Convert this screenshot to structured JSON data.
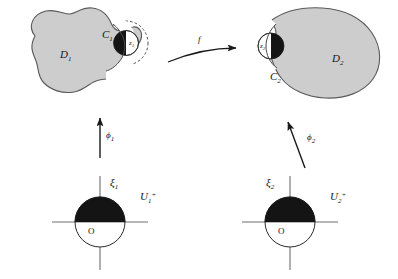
{
  "figure": {
    "type": "mathematical-diagram",
    "background_color": "#ffffff",
    "domain_fill_color": "#cdcdcd",
    "domain_stroke_color": "#5a5a5a",
    "black_fill_color": "#141414",
    "axis_color": "#6e6e6e",
    "arrow_color": "#1a1a1a",
    "dashed_color": "#3c3c3c"
  },
  "left_domain": {
    "region_label": "D",
    "region_sub": "1",
    "boundary_arc_label": "C",
    "boundary_arc_sub": "1",
    "point_label": "z",
    "point_sub": "1"
  },
  "right_domain": {
    "region_label": "D",
    "region_sub": "2",
    "boundary_arc_label": "C",
    "boundary_arc_sub": "2",
    "point_label": "z",
    "point_sub": "2"
  },
  "maps": {
    "horizontal_label": "f",
    "left_vertical_label": "ϕ",
    "left_vertical_sub": "1",
    "right_vertical_label": "ϕ",
    "right_vertical_sub": "2"
  },
  "left_half_disk": {
    "axis_label": "ξ",
    "axis_sub": "1",
    "set_label": "U",
    "set_sub": "1",
    "set_sup": "+",
    "origin_label": "O"
  },
  "right_half_disk": {
    "axis_label": "ξ",
    "axis_sub": "2",
    "set_label": "U",
    "set_sub": "2",
    "set_sup": "+",
    "origin_label": "O"
  }
}
